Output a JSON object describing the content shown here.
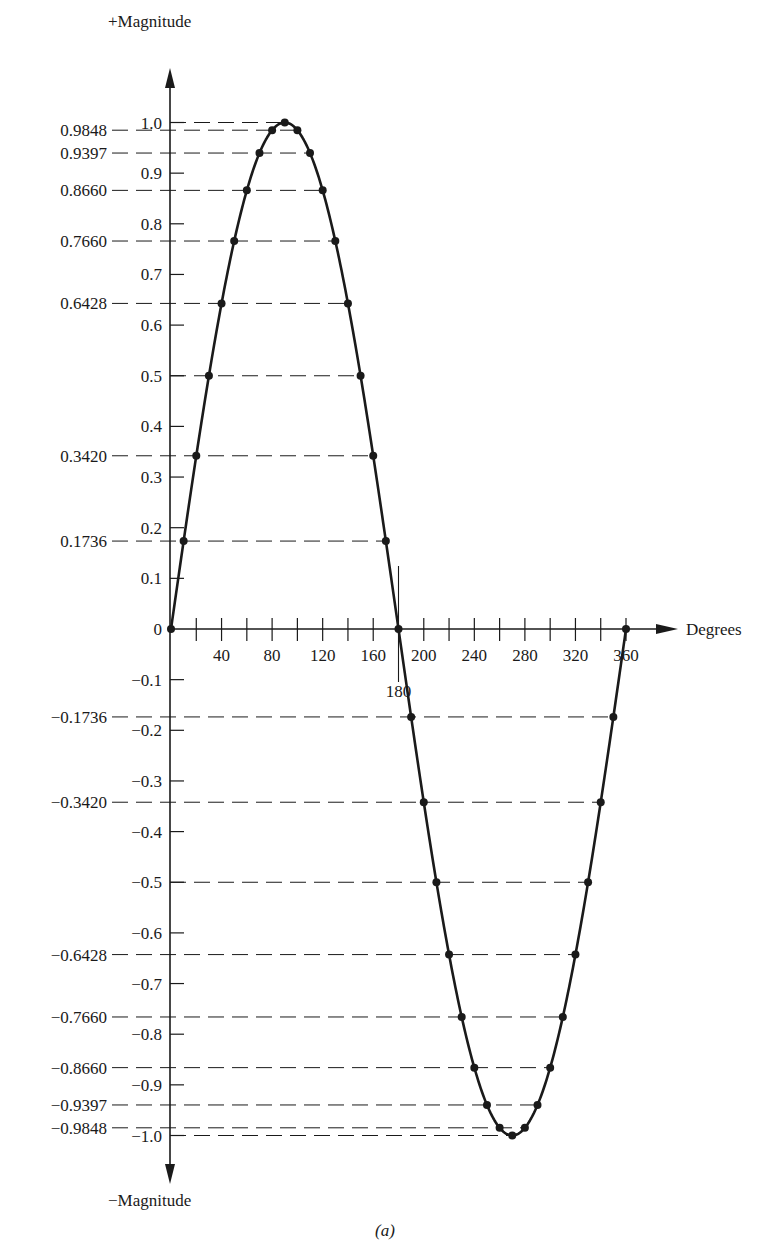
{
  "chart_data": {
    "type": "line",
    "title": "",
    "caption": "(a)",
    "xlabel": "Degrees",
    "ylabel_top": "+Magnitude",
    "ylabel_bottom": "−Magnitude",
    "xlim": [
      0,
      360
    ],
    "ylim": [
      -1.0,
      1.0
    ],
    "x_ticks": [
      40,
      80,
      120,
      160,
      200,
      240,
      280,
      320,
      360
    ],
    "x_minor_tick_step": 20,
    "x_special_marker": {
      "value": 180,
      "label": "180"
    },
    "y_ticks": [
      1.0,
      0.9,
      0.8,
      0.7,
      0.6,
      0.5,
      0.4,
      0.3,
      0.2,
      0.1,
      0,
      -0.1,
      -0.2,
      -0.3,
      -0.4,
      -0.5,
      -0.6,
      -0.7,
      -0.8,
      -0.9,
      -1.0
    ],
    "y_tick_labels": [
      "1.0",
      "0.9",
      "0.8",
      "0.7",
      "0.6",
      "0.5",
      "0.4",
      "0.3",
      "0.2",
      "0.1",
      "0",
      "−0.1",
      "−0.2",
      "−0.3",
      "−0.4",
      "−0.5",
      "−0.6",
      "−0.7",
      "−0.8",
      "−0.9",
      "−1.0"
    ],
    "reference_levels": [
      0.9848,
      0.9397,
      0.866,
      0.766,
      0.6428,
      0.342,
      0.1736,
      -0.1736,
      -0.342,
      -0.6428,
      -0.766,
      -0.866,
      -0.9397,
      -0.9848
    ],
    "reference_level_labels": [
      "0.9848",
      "0.9397",
      "0.8660",
      "0.7660",
      "0.6428",
      "0.3420",
      "0.1736",
      "−0.1736",
      "−0.3420",
      "−0.6428",
      "−0.7660",
      "−0.8660",
      "−0.9397",
      "−0.9848"
    ],
    "dashed_levels_inner": [
      1.0,
      0.5,
      -0.5,
      -1.0
    ],
    "grid": false,
    "legend": null,
    "series": [
      {
        "name": "sin(θ)",
        "x": [
          0,
          10,
          20,
          30,
          40,
          50,
          60,
          70,
          80,
          90,
          100,
          110,
          120,
          130,
          140,
          150,
          160,
          170,
          180,
          190,
          200,
          210,
          220,
          230,
          240,
          250,
          260,
          270,
          280,
          290,
          300,
          310,
          320,
          330,
          340,
          350,
          360
        ],
        "values": [
          0,
          0.1736,
          0.342,
          0.5,
          0.6428,
          0.766,
          0.866,
          0.9397,
          0.9848,
          1.0,
          0.9848,
          0.9397,
          0.866,
          0.766,
          0.6428,
          0.5,
          0.342,
          0.1736,
          0,
          -0.1736,
          -0.342,
          -0.5,
          -0.6428,
          -0.766,
          -0.866,
          -0.9397,
          -0.9848,
          -1.0,
          -0.9848,
          -0.9397,
          -0.866,
          -0.766,
          -0.6428,
          -0.5,
          -0.342,
          -0.1736,
          0
        ]
      }
    ]
  },
  "colors": {
    "ink": "#1a1a1a",
    "background": "#ffffff"
  }
}
